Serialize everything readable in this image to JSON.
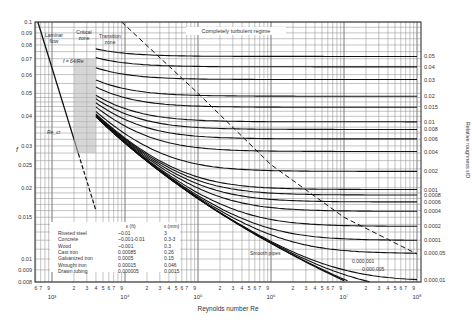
{
  "chart_data": {
    "type": "line",
    "xlabel": "Reynolds number Re",
    "ylabel": "f",
    "ylabel_right": "Relative roughness ε/D",
    "xscale": "log",
    "yscale": "log",
    "xlim": [
      650,
      100000000
    ],
    "ylim": [
      0.008,
      0.1
    ],
    "grid": true,
    "x_decades": [
      {
        "label": "10³",
        "value": 1000
      },
      {
        "label": "10⁴",
        "value": 10000
      },
      {
        "label": "10⁵",
        "value": 100000
      },
      {
        "label": "10⁶",
        "value": 1000000
      },
      {
        "label": "10⁷",
        "value": 10000000
      },
      {
        "label": "10⁸",
        "value": 100000000
      }
    ],
    "x_minor_tick_labels": [
      "2",
      "3",
      "4",
      "5",
      "6",
      "7",
      "9"
    ],
    "y_ticks_left": [
      "0.1",
      "0.09",
      "0.08",
      "0.07",
      "0.06",
      "0.05",
      "0.04",
      "0.03",
      "0.025",
      "0.02",
      "0.015",
      "0.01",
      "0.009",
      "0.008"
    ],
    "y_tick_values_left": [
      0.1,
      0.09,
      0.08,
      0.07,
      0.06,
      0.05,
      0.04,
      0.03,
      0.025,
      0.02,
      0.015,
      0.01,
      0.009,
      0.008
    ],
    "relative_roughness_labels": [
      "0.05",
      "0.04",
      "0.03",
      "0.02",
      "0.015",
      "0.01",
      "0.008",
      "0.006",
      "0.004",
      "0.002",
      "0.001",
      "0.0008",
      "0.0006",
      "0.0004",
      "0.0002",
      "0.0001",
      "0.000,05",
      "0.000,01"
    ],
    "relative_roughness_values": [
      0.05,
      0.04,
      0.03,
      0.02,
      0.015,
      0.01,
      0.008,
      0.006,
      0.004,
      0.002,
      0.001,
      0.0008,
      0.0006,
      0.0004,
      0.0002,
      0.0001,
      5e-05,
      1e-05
    ],
    "extra_curve_labels": [
      {
        "label": "0.000,001",
        "value": 1e-06
      },
      {
        "label": "0.000,005",
        "value": 5e-06
      }
    ],
    "series": [
      {
        "name": "Laminar f = 64/Re",
        "x": [
          650,
          2300,
          4000
        ],
        "y": [
          0.0985,
          0.0278,
          0.016
        ]
      },
      {
        "name": "Smooth pipes",
        "x": [
          4000,
          10000,
          100000,
          1000000,
          10000000
        ],
        "y": [
          0.04,
          0.031,
          0.018,
          0.0116,
          0.0081
        ]
      },
      {
        "name": "Boundary of completely turbulent regime (dashed)",
        "x": [
          9000,
          100000,
          1000000,
          10000000,
          100000000
        ],
        "y": [
          0.1,
          0.05,
          0.025,
          0.015,
          0.0105
        ]
      }
    ],
    "annotations": {
      "laminar": "Laminar flow",
      "laminar_eq": "f = 64/Re",
      "critical": "Critical zone",
      "transition": "Transition zone",
      "turbulent": "Completely turbulent regime",
      "recr": "Re_cr",
      "smooth": "Smooth pipes"
    },
    "roughness_table": {
      "headers": [
        "",
        "ε (ft)",
        "ε (mm)"
      ],
      "rows": [
        [
          "Riveted steel",
          "~0.01",
          "3"
        ],
        [
          "Concrete",
          "~0.001-0.01",
          "0.3-3"
        ],
        [
          "Wood",
          "~0.001",
          "0.3"
        ],
        [
          "Cast iron",
          "0.00085",
          "0.26"
        ],
        [
          "Galvanized iron",
          "0.0005",
          "0.15"
        ],
        [
          "Wrought iron",
          "0.00015",
          "0.046"
        ],
        [
          "Drawn tubing",
          "0.000005",
          "0.0015"
        ]
      ]
    }
  }
}
